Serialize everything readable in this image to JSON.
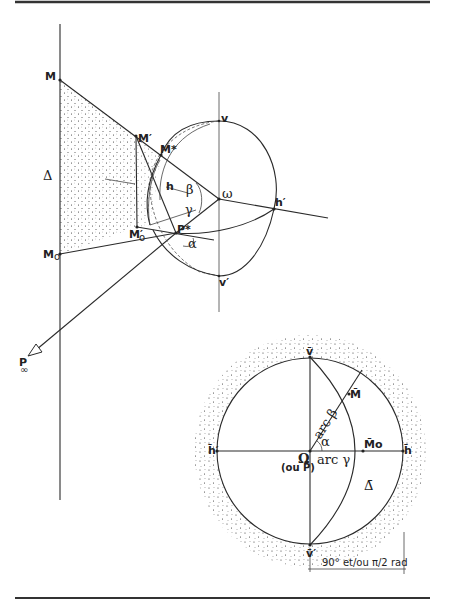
{
  "figure": {
    "upper": {
      "line_label": "Δ",
      "points": {
        "M": "M",
        "M0": "M",
        "M0_sub": "o",
        "M_prime": "M′",
        "M0_prime": "M′",
        "M0_prime_sub": "o",
        "M_star": "M*",
        "P_star": "P*",
        "omega": "ω",
        "h_prime": "h′",
        "v": "v",
        "v_prime": "v′",
        "P_inf": "P",
        "P_inf_sub": "∞",
        "h": "h"
      },
      "angles": {
        "beta": "β",
        "gamma": "γ",
        "alpha": "α"
      }
    },
    "lower": {
      "points": {
        "v_bar": "v̄",
        "v_bar_prime": "v̄′",
        "h_bar": "h̄",
        "h_bar_prime": "h̄′",
        "M_bar": "M̄",
        "M0_bar": "M̄o",
        "Omega": "Ω",
        "ou_P": "(ou P̄)",
        "Delta_bar": "Δ̄"
      },
      "arcs": {
        "arc_beta": "arc β",
        "arc_gamma": "arc γ",
        "alpha": "α"
      },
      "scale_label": "90° et/ou π/2 rad"
    }
  },
  "colors": {
    "ink": "#2a2a2a",
    "paper": "#ffffff",
    "rule": "#333333"
  }
}
